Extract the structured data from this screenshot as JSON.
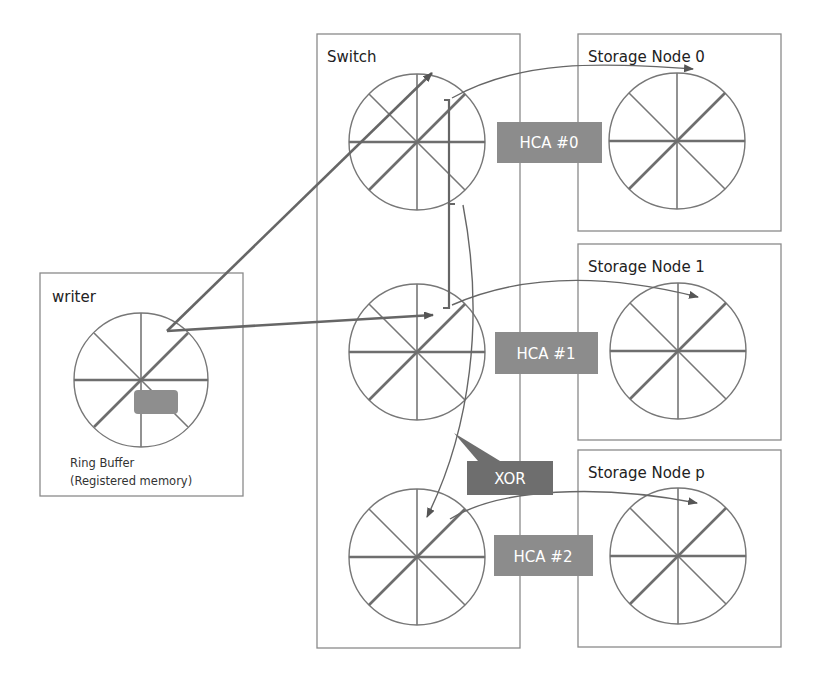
{
  "diagram": {
    "writer": {
      "title": "writer",
      "caption_line1": "Ring Buffer",
      "caption_line2": "(Registered memory)"
    },
    "switch": {
      "title": "Switch"
    },
    "storage_nodes": [
      {
        "title": "Storage Node 0"
      },
      {
        "title": "Storage Node 1"
      },
      {
        "title": "Storage Node p"
      }
    ],
    "hca_labels": [
      "HCA #0",
      "HCA #1",
      "HCA #2"
    ],
    "xor_label": "XOR",
    "colors": {
      "tag_fill": "#8c8c8c",
      "line": "#777777",
      "box_border": "#8a8a8a"
    }
  }
}
